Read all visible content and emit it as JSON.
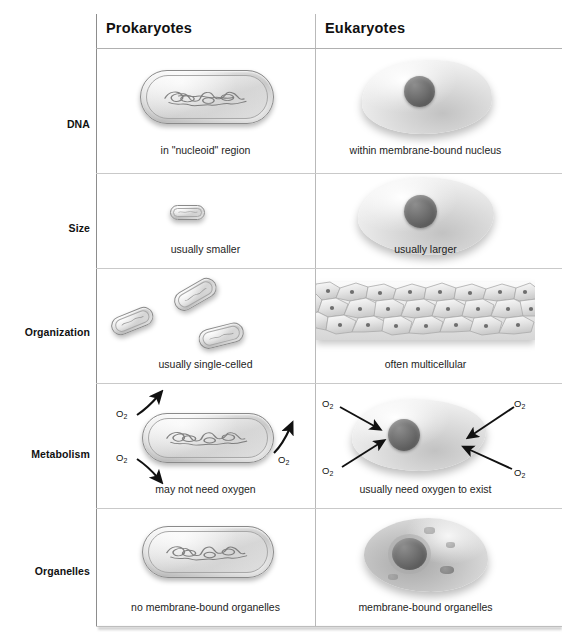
{
  "figure": {
    "columns": [
      "Prokaryotes",
      "Eukaryotes"
    ],
    "row_label_header": ""
  },
  "rows": [
    {
      "label": "DNA",
      "prokaryote_caption": "in \"nucleoid\" region",
      "eukaryote_caption": "within membrane-bound nucleus",
      "prokaryote_art": "rod-bacterium-with-nucleoid",
      "eukaryote_art": "amoeboid-cell-with-nucleus"
    },
    {
      "label": "Size",
      "prokaryote_caption": "usually smaller",
      "eukaryote_caption": "usually larger",
      "prokaryote_art": "tiny-rod-bacterium",
      "eukaryote_art": "large-amoeboid-cell-with-nucleus"
    },
    {
      "label": "Organization",
      "prokaryote_caption": "usually single-celled",
      "eukaryote_caption": "often multicellular",
      "prokaryote_art": "three-scattered-rod-bacteria",
      "eukaryote_art": "multicellular-tissue-sheet"
    },
    {
      "label": "Metabolism",
      "prokaryote_caption": "may not need oxygen",
      "eukaryote_caption": "usually need oxygen to exist",
      "prokaryote_art": "rod-bacterium-with-outward-oxygen-arrows",
      "eukaryote_art": "amoeboid-cell-with-inward-oxygen-arrows",
      "prokaryote_oxygen_labels": [
        "O2",
        "O2",
        "O2"
      ],
      "eukaryote_oxygen_labels": [
        "O2",
        "O2",
        "O2",
        "O2"
      ],
      "oxygen_symbol": "O",
      "oxygen_subscript": "2"
    },
    {
      "label": "Organelles",
      "prokaryote_caption": "no membrane-bound organelles",
      "eukaryote_caption": "membrane-bound organelles",
      "prokaryote_art": "rod-bacterium-with-nucleoid",
      "eukaryote_art": "amoeboid-cell-with-nucleus-and-organelles"
    }
  ],
  "colors": {
    "background": "#ffffff",
    "text": "#1a1a1a",
    "grid_line": "#c9c9c9",
    "header_line": "#b0b0b0",
    "border_left": "#8d8d8d",
    "cell_fill_light": "#f2f2f2",
    "cell_fill_mid": "#c9c9c9",
    "nucleus_dark": "#565656"
  }
}
